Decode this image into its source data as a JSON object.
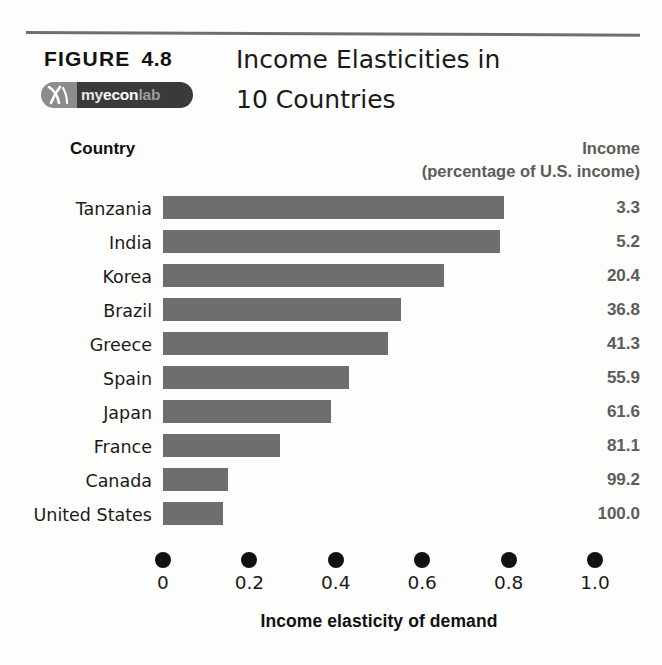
{
  "figure": {
    "label_word": "FIGURE",
    "number": "4.8",
    "title_line1": "Income Elasticities in",
    "title_line2": "10 Countries"
  },
  "logo": {
    "mark": "myeconlab-x-icon",
    "part1": "my",
    "part2": "econ",
    "part3": "lab"
  },
  "headers": {
    "country": "Country",
    "income_line1": "Income",
    "income_line2": "(percentage of U.S. income)"
  },
  "chart_data": {
    "type": "bar",
    "orientation": "horizontal",
    "title": "Income Elasticities in 10 Countries",
    "xlabel": "Income elasticity of demand",
    "ylabel": "Country",
    "xlim": [
      0,
      1.0
    ],
    "xticks": [
      "0",
      "0.2",
      "0.4",
      "0.6",
      "0.8",
      "1.0"
    ],
    "xtick_values": [
      0,
      0.2,
      0.4,
      0.6,
      0.8,
      1.0
    ],
    "grid": false,
    "legend": null,
    "bar_color": "#6e6e6e",
    "categories": [
      "Tanzania",
      "India",
      "Korea",
      "Brazil",
      "Greece",
      "Spain",
      "Japan",
      "France",
      "Canada",
      "United States"
    ],
    "values": [
      0.79,
      0.78,
      0.65,
      0.55,
      0.52,
      0.43,
      0.39,
      0.27,
      0.15,
      0.14
    ],
    "series": [
      {
        "name": "Income elasticity of demand",
        "values": [
          0.79,
          0.78,
          0.65,
          0.55,
          0.52,
          0.43,
          0.39,
          0.27,
          0.15,
          0.14
        ]
      },
      {
        "name": "Income (percentage of U.S. income)",
        "values": [
          3.3,
          5.2,
          20.4,
          36.8,
          41.3,
          55.9,
          61.6,
          81.1,
          99.2,
          100.0
        ]
      }
    ],
    "rows": [
      {
        "country": "Tanzania",
        "elasticity": 0.79,
        "income": "3.3"
      },
      {
        "country": "India",
        "elasticity": 0.78,
        "income": "5.2"
      },
      {
        "country": "Korea",
        "elasticity": 0.65,
        "income": "20.4"
      },
      {
        "country": "Brazil",
        "elasticity": 0.55,
        "income": "36.8"
      },
      {
        "country": "Greece",
        "elasticity": 0.52,
        "income": "41.3"
      },
      {
        "country": "Spain",
        "elasticity": 0.43,
        "income": "55.9"
      },
      {
        "country": "Japan",
        "elasticity": 0.39,
        "income": "61.6"
      },
      {
        "country": "France",
        "elasticity": 0.27,
        "income": "81.1"
      },
      {
        "country": "Canada",
        "elasticity": 0.15,
        "income": "99.2"
      },
      {
        "country": "United States",
        "elasticity": 0.14,
        "income": "100.0"
      }
    ]
  }
}
